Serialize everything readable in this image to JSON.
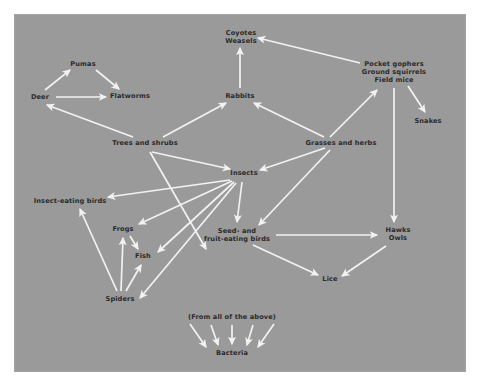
{
  "diagram": {
    "background_color": "#9a9a9a",
    "arrow_color": "#f2f2f2",
    "text_color": "#2b2b2b",
    "nodes": [
      {
        "id": "pumas",
        "label": "Pumas",
        "x": 83,
        "y": 64
      },
      {
        "id": "deer",
        "label": "Deer",
        "x": 40,
        "y": 97
      },
      {
        "id": "flatworms",
        "label": "Flatworms",
        "x": 130,
        "y": 96
      },
      {
        "id": "coyotes",
        "label": "Coyotes\nWeasels",
        "x": 241,
        "y": 37
      },
      {
        "id": "rabbits",
        "label": "Rabbits",
        "x": 240,
        "y": 96
      },
      {
        "id": "gophers",
        "label": "Pocket gophers\nGround squirrels\nField mice",
        "x": 394,
        "y": 72
      },
      {
        "id": "snakes",
        "label": "Snakes",
        "x": 428,
        "y": 121
      },
      {
        "id": "trees",
        "label": "Trees and shrubs",
        "x": 145,
        "y": 143
      },
      {
        "id": "grasses",
        "label": "Grasses and herbs",
        "x": 341,
        "y": 143
      },
      {
        "id": "insects",
        "label": "Insects",
        "x": 244,
        "y": 173
      },
      {
        "id": "insectbirds",
        "label": "Insect-eating birds",
        "x": 70,
        "y": 201
      },
      {
        "id": "frogs",
        "label": "Frogs",
        "x": 123,
        "y": 229
      },
      {
        "id": "fish",
        "label": "Fish",
        "x": 143,
        "y": 256
      },
      {
        "id": "spiders",
        "label": "Spiders",
        "x": 120,
        "y": 299
      },
      {
        "id": "seedbirds",
        "label": "Seed- and\nfruit-eating birds",
        "x": 237,
        "y": 235
      },
      {
        "id": "hawks",
        "label": "Hawks\nOwls",
        "x": 398,
        "y": 234
      },
      {
        "id": "lice",
        "label": "Lice",
        "x": 330,
        "y": 279
      },
      {
        "id": "fromabove",
        "label": "(From all of the above)",
        "x": 232,
        "y": 317
      },
      {
        "id": "bacteria",
        "label": "Bacteria",
        "x": 232,
        "y": 353
      }
    ],
    "edges": [
      {
        "from": "deer",
        "to": "pumas",
        "x1": 45,
        "y1": 90,
        "x2": 70,
        "y2": 70
      },
      {
        "from": "pumas",
        "to": "flatworms",
        "x1": 96,
        "y1": 70,
        "x2": 119,
        "y2": 89
      },
      {
        "from": "deer",
        "to": "flatworms",
        "x1": 56,
        "y1": 97,
        "x2": 106,
        "y2": 97
      },
      {
        "from": "trees",
        "to": "deer",
        "x1": 133,
        "y1": 137,
        "x2": 47,
        "y2": 105
      },
      {
        "from": "trees",
        "to": "rabbits",
        "x1": 163,
        "y1": 137,
        "x2": 226,
        "y2": 103
      },
      {
        "from": "trees",
        "to": "insects",
        "x1": 152,
        "y1": 152,
        "x2": 230,
        "y2": 169
      },
      {
        "from": "trees",
        "to": "spiders",
        "x1": 150,
        "y1": 152,
        "x2": 206,
        "y2": 249
      },
      {
        "from": "rabbits",
        "to": "coyotes",
        "x1": 240,
        "y1": 88,
        "x2": 240,
        "y2": 48
      },
      {
        "from": "gophers",
        "to": "coyotes",
        "x1": 360,
        "y1": 63,
        "x2": 258,
        "y2": 38
      },
      {
        "from": "gophers",
        "to": "snakes",
        "x1": 408,
        "y1": 86,
        "x2": 425,
        "y2": 112
      },
      {
        "from": "gophers",
        "to": "hawks",
        "x1": 394,
        "y1": 88,
        "x2": 394,
        "y2": 222
      },
      {
        "from": "grasses",
        "to": "rabbits",
        "x1": 324,
        "y1": 137,
        "x2": 254,
        "y2": 103
      },
      {
        "from": "grasses",
        "to": "gophers",
        "x1": 330,
        "y1": 137,
        "x2": 377,
        "y2": 90
      },
      {
        "from": "grasses",
        "to": "insects",
        "x1": 325,
        "y1": 148,
        "x2": 260,
        "y2": 170
      },
      {
        "from": "grasses",
        "to": "seedbirds",
        "x1": 330,
        "y1": 150,
        "x2": 259,
        "y2": 225
      },
      {
        "from": "insects",
        "to": "insectbirds",
        "x1": 230,
        "y1": 180,
        "x2": 108,
        "y2": 197
      },
      {
        "from": "insects",
        "to": "frogs",
        "x1": 232,
        "y1": 181,
        "x2": 139,
        "y2": 224
      },
      {
        "from": "insects",
        "to": "fish",
        "x1": 234,
        "y1": 182,
        "x2": 158,
        "y2": 252
      },
      {
        "from": "insects",
        "to": "spiders",
        "x1": 236,
        "y1": 183,
        "x2": 140,
        "y2": 298
      },
      {
        "from": "insects",
        "to": "seedbirds",
        "x1": 242,
        "y1": 182,
        "x2": 237,
        "y2": 222
      },
      {
        "from": "spiders",
        "to": "insectbirds",
        "x1": 117,
        "y1": 291,
        "x2": 80,
        "y2": 209
      },
      {
        "from": "spiders",
        "to": "frogs",
        "x1": 121,
        "y1": 291,
        "x2": 123,
        "y2": 238
      },
      {
        "from": "spiders",
        "to": "fish",
        "x1": 126,
        "y1": 291,
        "x2": 141,
        "y2": 265
      },
      {
        "from": "frogs",
        "to": "fish",
        "x1": 130,
        "y1": 236,
        "x2": 138,
        "y2": 249
      },
      {
        "from": "seedbirds",
        "to": "hawks",
        "x1": 276,
        "y1": 235,
        "x2": 377,
        "y2": 235
      },
      {
        "from": "seedbirds",
        "to": "lice",
        "x1": 253,
        "y1": 245,
        "x2": 318,
        "y2": 275
      },
      {
        "from": "hawks",
        "to": "lice",
        "x1": 386,
        "y1": 246,
        "x2": 342,
        "y2": 276
      },
      {
        "from": "fromabove",
        "to": "bacteria",
        "x1": 190,
        "y1": 324,
        "x2": 206,
        "y2": 347
      },
      {
        "from": "fromabove",
        "to": "bacteria",
        "x1": 211,
        "y1": 325,
        "x2": 218,
        "y2": 345
      },
      {
        "from": "fromabove",
        "to": "bacteria",
        "x1": 232,
        "y1": 325,
        "x2": 232,
        "y2": 344
      },
      {
        "from": "fromabove",
        "to": "bacteria",
        "x1": 253,
        "y1": 325,
        "x2": 247,
        "y2": 345
      },
      {
        "from": "fromabove",
        "to": "bacteria",
        "x1": 274,
        "y1": 324,
        "x2": 258,
        "y2": 347
      }
    ]
  }
}
